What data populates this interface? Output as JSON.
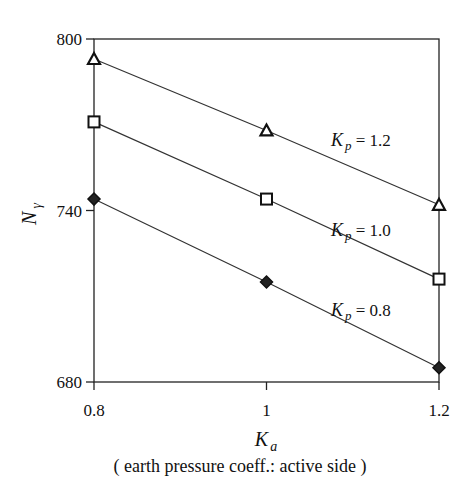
{
  "chart_data": {
    "type": "line",
    "title": "",
    "xlabel": "K_a",
    "xlabel_main": "K",
    "xlabel_sub": "a",
    "xlabel_caption": "( earth pressure coeff.: active side )",
    "ylabel": "N_γ",
    "ylabel_main": "N",
    "ylabel_sub": "γ",
    "x": [
      0.8,
      1.0,
      1.2
    ],
    "x_tick_labels": [
      "0.8",
      "1",
      "1.2"
    ],
    "y_tick_values": [
      680,
      740,
      800
    ],
    "y_tick_labels": [
      "680",
      "740",
      "800"
    ],
    "xlim": [
      0.8,
      1.2
    ],
    "ylim": [
      680,
      800
    ],
    "grid": false,
    "legend_position": "inline labels",
    "series": [
      {
        "name": "K_p = 1.2",
        "label_main": "K",
        "label_sub": "p",
        "label_rest": " = 1.2",
        "marker": "triangle",
        "values": [
          793,
          768,
          742
        ]
      },
      {
        "name": "K_p = 1.0",
        "label_main": "K",
        "label_sub": "p",
        "label_rest": " = 1.0",
        "marker": "square",
        "values": [
          771,
          744,
          716
        ]
      },
      {
        "name": "K_p = 0.8",
        "label_main": "K",
        "label_sub": "p",
        "label_rest": " = 0.8",
        "marker": "diamond",
        "values": [
          744,
          715,
          685
        ]
      }
    ]
  }
}
